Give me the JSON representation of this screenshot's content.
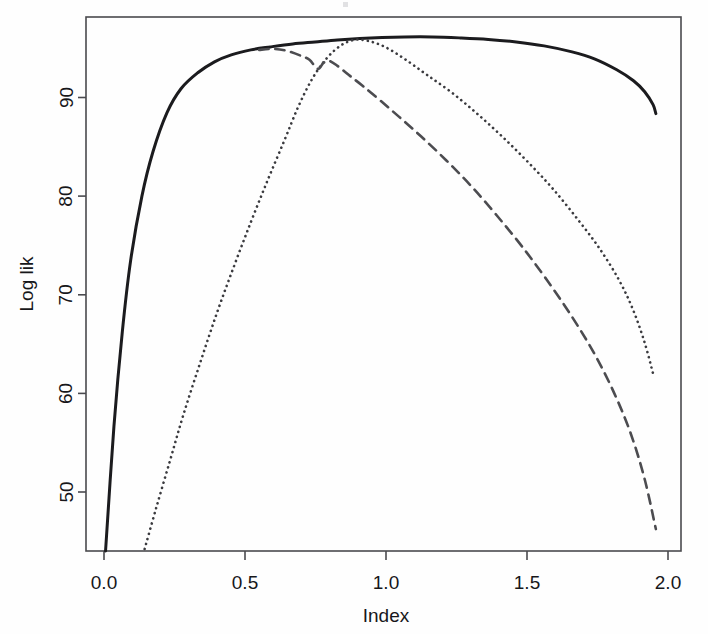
{
  "chart_data": {
    "type": "line",
    "title": "",
    "subtitle": "",
    "xlabel": "Index",
    "ylabel": "Log lik",
    "xlim": [
      -0.04,
      2.09
    ],
    "ylim": [
      43.0,
      96.6
    ],
    "grid": false,
    "legend": null,
    "legend_position": "none",
    "xticks": [
      "0.0",
      "0.5",
      "1.0",
      "1.5",
      "2.0"
    ],
    "xtick_values": [
      0.0,
      0.5,
      1.0,
      1.5,
      2.0
    ],
    "yticks": [
      "50",
      "60",
      "70",
      "80",
      "90"
    ],
    "ytick_values": [
      50,
      60,
      70,
      80,
      90
    ],
    "series": [
      {
        "name": "solid-curve",
        "style": "solid",
        "color": "#1b1b1e",
        "width": 3.0,
        "x": [
          0.03,
          0.06,
          0.09,
          0.12,
          0.16,
          0.2,
          0.25,
          0.3,
          0.36,
          0.42,
          0.48,
          0.55,
          0.62,
          0.7,
          0.78,
          0.86,
          0.94,
          1.02,
          1.1,
          1.2,
          1.3,
          1.4,
          1.5,
          1.6,
          1.7,
          1.78,
          1.86,
          1.92,
          1.96,
          1.99,
          2.0
        ],
        "y": [
          43.0,
          55.5,
          65.0,
          72.2,
          78.6,
          83.1,
          87.0,
          89.4,
          91.0,
          92.1,
          92.8,
          93.3,
          93.6,
          93.9,
          94.1,
          94.3,
          94.45,
          94.55,
          94.6,
          94.6,
          94.5,
          94.35,
          94.1,
          93.7,
          93.1,
          92.4,
          91.3,
          90.2,
          89.1,
          87.8,
          86.9
        ]
      },
      {
        "name": "dotted-curve",
        "style": "dotted",
        "color": "#3a3a3e",
        "width": 2.6,
        "x": [
          0.17,
          0.21,
          0.26,
          0.31,
          0.37,
          0.43,
          0.49,
          0.55,
          0.61,
          0.67,
          0.72,
          0.77,
          0.82,
          0.87,
          0.92,
          0.97,
          1.03,
          1.1,
          1.18,
          1.27,
          1.36,
          1.45,
          1.54,
          1.63,
          1.72,
          1.8,
          1.87,
          1.92,
          1.96,
          1.99
        ],
        "y": [
          43.2,
          47.2,
          52.0,
          56.8,
          62.0,
          67.0,
          71.6,
          76.0,
          80.2,
          84.2,
          87.6,
          90.4,
          92.4,
          93.7,
          94.3,
          94.2,
          93.6,
          92.4,
          90.8,
          89.0,
          86.9,
          84.6,
          82.1,
          79.4,
          76.3,
          73.3,
          70.1,
          67.1,
          63.9,
          60.8
        ]
      },
      {
        "name": "dashed-curve",
        "style": "dashed",
        "color": "#4c4c50",
        "width": 2.6,
        "x": [
          0.58,
          0.63,
          0.68,
          0.73,
          0.76,
          0.79,
          0.81,
          0.83,
          0.86,
          0.9,
          0.95,
          1.01,
          1.08,
          1.16,
          1.25,
          1.34,
          1.43,
          1.52,
          1.61,
          1.7,
          1.78,
          1.85,
          1.91,
          1.96,
          2.0
        ],
        "y": [
          93.3,
          93.4,
          93.2,
          92.7,
          92.3,
          91.4,
          92.0,
          92.2,
          91.7,
          90.8,
          89.7,
          88.3,
          86.6,
          84.6,
          82.2,
          79.6,
          76.7,
          73.6,
          70.2,
          66.5,
          62.8,
          58.9,
          54.8,
          50.2,
          45.2
        ]
      }
    ]
  },
  "artifacts": {
    "top_speck_label": ""
  }
}
